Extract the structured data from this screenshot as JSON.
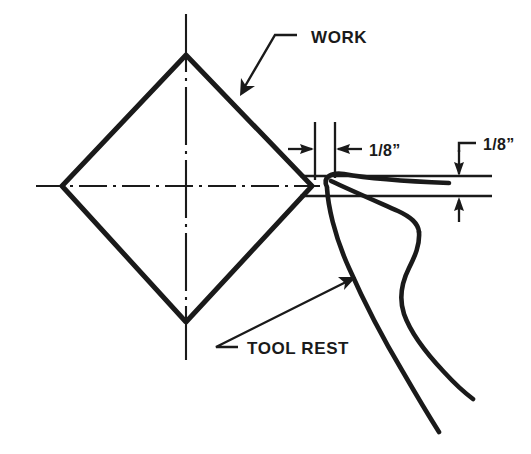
{
  "figure": {
    "background_color": "#ffffff",
    "ink_color": "#1a1a1a",
    "width": 531,
    "height": 454
  },
  "labels": {
    "work": "WORK",
    "tool_rest": "TOOL REST",
    "gap_horizontal": "1/8”",
    "gap_vertical": "1/8”"
  },
  "annotations": [
    {
      "name": "work-callout",
      "text": "WORK",
      "leader": "horizontal stub then diagonal down-left to arrowhead on upper-right edge of work"
    },
    {
      "name": "tool-rest-callout",
      "text": "TOOL REST",
      "leader": "horizontal stub then diagonal up-right to arrowhead on tool rest body"
    },
    {
      "name": "horizontal-clearance",
      "text": "1/8”",
      "description": "horizontal gap between work and tool rest, arrows pointing inward between two vertical extension lines"
    },
    {
      "name": "vertical-clearance",
      "text": "1/8”",
      "description": "vertical gap between two horizontal reference lines, arrows pointing outward"
    }
  ],
  "geometry": {
    "work_shape": "diamond",
    "work_vertices": [
      {
        "x": 186,
        "y": 55
      },
      {
        "x": 312,
        "y": 186
      },
      {
        "x": 186,
        "y": 322
      },
      {
        "x": 62,
        "y": 186
      }
    ],
    "centerlines": {
      "style": "dash-dot",
      "horizontal_y": 186,
      "vertical_x": 186
    }
  }
}
